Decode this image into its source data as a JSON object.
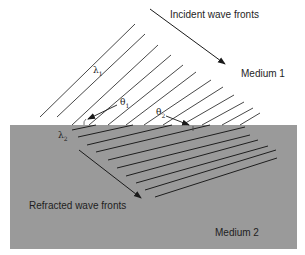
{
  "labels": {
    "incident": "Incident wave fronts",
    "refracted": "Refracted wave fronts",
    "medium1": "Medium 1",
    "medium2": "Medium 2"
  },
  "symbols": {
    "lambda1": "λ",
    "lambda1_sub": "1",
    "lambda2": "λ",
    "lambda2_sub": "2",
    "theta1": "θ",
    "theta1_sub": "1",
    "theta2": "θ",
    "theta2_sub": "2"
  },
  "colors": {
    "medium2_fill": "#9a9a9a",
    "line": "#2a2a2a",
    "background": "#ffffff"
  }
}
